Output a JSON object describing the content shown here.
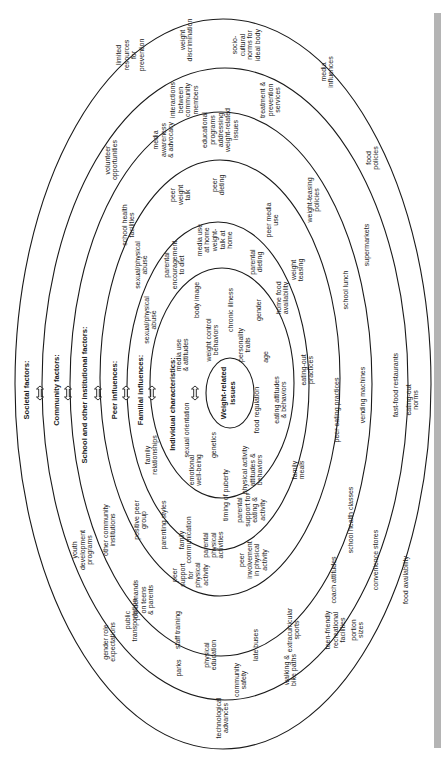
{
  "diagram": {
    "center_label": [
      "Weight-related",
      "issues"
    ],
    "rings": [
      {
        "id": "societal",
        "title": "Societal factors:",
        "cx": 223,
        "cy": 384,
        "rx": 208,
        "ry": 365,
        "title_x": 26,
        "arrow_x": 40
      },
      {
        "id": "community",
        "title": "Community factors:",
        "cx": 225,
        "cy": 384,
        "rx": 183,
        "ry": 316,
        "title_x": 56,
        "arrow_x": 68
      },
      {
        "id": "school",
        "title": "School and other institutional factors:",
        "cx": 221,
        "cy": 384,
        "rx": 151,
        "ry": 272,
        "title_x": 84,
        "arrow_x": 98
      },
      {
        "id": "peer",
        "title": "Peer influences:",
        "cx": 220,
        "cy": 378,
        "rx": 120,
        "ry": 218,
        "title_x": 114,
        "arrow_x": 126
      },
      {
        "id": "familial",
        "title": "Familial influences:",
        "cx": 218,
        "cy": 386,
        "rx": 91,
        "ry": 164,
        "title_x": 140,
        "arrow_x": 152
      },
      {
        "id": "individual",
        "title": "Individual characteristics:",
        "cx": 222,
        "cy": 383,
        "rx": 72,
        "ry": 115,
        "title_x": 172,
        "arrow_x": 195
      }
    ],
    "center": {
      "cx": 230,
      "cy": 393,
      "rx": 24,
      "ry": 35,
      "label_x": 226
    },
    "title_y": 400,
    "societal_items": [
      {
        "lines": [
          "limited",
          "resources",
          "for",
          "prevention"
        ],
        "x": 130,
        "y": 55
      },
      {
        "lines": [
          "weight",
          "discrimination"
        ],
        "x": 186,
        "y": 40
      },
      {
        "lines": [
          "socio-",
          "cultural",
          "norms for",
          "ideal body"
        ],
        "x": 246,
        "y": 45
      },
      {
        "lines": [
          "media",
          "influences"
        ],
        "x": 327,
        "y": 72
      },
      {
        "lines": [
          "food",
          "policies"
        ],
        "x": 372,
        "y": 158
      },
      {
        "lines": [
          "supermarkets"
        ],
        "x": 366,
        "y": 245
      },
      {
        "lines": [
          "eating-out",
          "norms"
        ],
        "x": 412,
        "y": 400
      },
      {
        "lines": [
          "fast-food restaurants"
        ],
        "x": 395,
        "y": 385
      },
      {
        "lines": [
          "food availability"
        ],
        "x": 405,
        "y": 580
      },
      {
        "lines": [
          "portion",
          "sizes"
        ],
        "x": 357,
        "y": 630
      },
      {
        "lines": [
          "technological",
          "advances"
        ],
        "x": 222,
        "y": 718
      },
      {
        "lines": [
          "gender role",
          "expectations"
        ],
        "x": 109,
        "y": 642
      },
      {
        "lines": [
          "youth",
          "development",
          "programs"
        ],
        "x": 82,
        "y": 550
      }
    ],
    "community_items": [
      {
        "lines": [
          "interactions",
          "between",
          "community",
          "members"
        ],
        "x": 184,
        "y": 100
      },
      {
        "lines": [
          "treatment &",
          "prevention",
          "services"
        ],
        "x": 270,
        "y": 100
      },
      {
        "lines": [
          "volunteer",
          "opportunities"
        ],
        "x": 111,
        "y": 160
      },
      {
        "lines": [
          "weight-teasing",
          "policies"
        ],
        "x": 313,
        "y": 200
      },
      {
        "lines": [
          "school lunch"
        ],
        "x": 345,
        "y": 290
      },
      {
        "lines": [
          "vending machines"
        ],
        "x": 362,
        "y": 395
      },
      {
        "lines": [
          "convenience stores"
        ],
        "x": 375,
        "y": 560
      },
      {
        "lines": [
          "teen-friendly",
          "recreational",
          "facilities"
        ],
        "x": 335,
        "y": 630
      },
      {
        "lines": [
          "walking &",
          "bike paths"
        ],
        "x": 290,
        "y": 670
      },
      {
        "lines": [
          "community",
          "safety"
        ],
        "x": 240,
        "y": 680
      },
      {
        "lines": [
          "parks"
        ],
        "x": 178,
        "y": 668
      },
      {
        "lines": [
          "public",
          "transportation"
        ],
        "x": 131,
        "y": 620
      },
      {
        "lines": [
          "other community",
          "institutions"
        ],
        "x": 109,
        "y": 530
      }
    ],
    "school_items": [
      {
        "lines": [
          "media",
          "awareness",
          "& advocacy"
        ],
        "x": 163,
        "y": 140
      },
      {
        "lines": [
          "educational",
          "programs",
          "addressing",
          "weight-related",
          "issues"
        ],
        "x": 220,
        "y": 130
      },
      {
        "lines": [
          "school health",
          "facilities"
        ],
        "x": 128,
        "y": 225
      },
      {
        "lines": [
          "weight",
          "teasing"
        ],
        "x": 297,
        "y": 270
      },
      {
        "lines": [
          "peer eating practices"
        ],
        "x": 336,
        "y": 410
      },
      {
        "lines": [
          "school health classes"
        ],
        "x": 350,
        "y": 520
      },
      {
        "lines": [
          "coach attitudes"
        ],
        "x": 333,
        "y": 580
      },
      {
        "lines": [
          "extracurricular",
          "sports"
        ],
        "x": 293,
        "y": 630
      },
      {
        "lines": [
          "late buses"
        ],
        "x": 255,
        "y": 645
      },
      {
        "lines": [
          "physical",
          "education"
        ],
        "x": 210,
        "y": 655
      },
      {
        "lines": [
          "staff training"
        ],
        "x": 177,
        "y": 630
      },
      {
        "lines": [
          "job demands",
          "on teens",
          "& parents"
        ],
        "x": 143,
        "y": 600
      }
    ],
    "peer_items": [
      {
        "lines": [
          "peer",
          "weight",
          "talk"
        ],
        "x": 180,
        "y": 195
      },
      {
        "lines": [
          "peer",
          "dieting"
        ],
        "x": 218,
        "y": 185
      },
      {
        "lines": [
          "peer media",
          "use"
        ],
        "x": 272,
        "y": 220
      },
      {
        "lines": [
          "sexual/physical",
          "abuse"
        ],
        "x": 141,
        "y": 265
      },
      {
        "lines": [
          "eating-out",
          "practices"
        ],
        "x": 307,
        "y": 370
      },
      {
        "lines": [
          "family",
          "meals"
        ],
        "x": 298,
        "y": 470
      },
      {
        "lines": [
          "peer",
          "involvement",
          "in physical",
          "activity"
        ],
        "x": 253,
        "y": 560
      },
      {
        "lines": [
          "peer",
          "support",
          "for",
          "physical",
          "activity"
        ],
        "x": 190,
        "y": 575
      },
      {
        "lines": [
          "positive peer",
          "group"
        ],
        "x": 140,
        "y": 520
      }
    ],
    "familial_items": [
      {
        "lines": [
          "parental",
          "encouragement",
          "to diet"
        ],
        "x": 174,
        "y": 265
      },
      {
        "lines": [
          "media use",
          "at home"
        ],
        "x": 203,
        "y": 240
      },
      {
        "lines": [
          "weight-",
          "talk at",
          "home"
        ],
        "x": 222,
        "y": 240
      },
      {
        "lines": [
          "parental",
          "dieting"
        ],
        "x": 256,
        "y": 262
      },
      {
        "lines": [
          "home food",
          "availability"
        ],
        "x": 282,
        "y": 298
      },
      {
        "lines": [
          "sexual/physical",
          "abuse"
        ],
        "x": 150,
        "y": 320
      },
      {
        "lines": [
          "family",
          "relationships"
        ],
        "x": 151,
        "y": 455
      },
      {
        "lines": [
          "parenting styles"
        ],
        "x": 163,
        "y": 525
      },
      {
        "lines": [
          "family",
          "communication"
        ],
        "x": 185,
        "y": 540
      },
      {
        "lines": [
          "parental",
          "physical",
          "activities"
        ],
        "x": 213,
        "y": 545
      },
      {
        "lines": [
          "parental",
          "support for",
          "eating &",
          "activity"
        ],
        "x": 251,
        "y": 510
      }
    ],
    "individual_items": [
      {
        "lines": [
          "media use",
          "& attitudes"
        ],
        "x": 182,
        "y": 355
      },
      {
        "lines": [
          "sexual orientation"
        ],
        "x": 186,
        "y": 430
      },
      {
        "lines": [
          "body image"
        ],
        "x": 196,
        "y": 300
      },
      {
        "lines": [
          "weight control",
          "behaviors"
        ],
        "x": 212,
        "y": 340
      },
      {
        "lines": [
          "chronic illness"
        ],
        "x": 230,
        "y": 310
      },
      {
        "lines": [
          "personality",
          "traits"
        ],
        "x": 244,
        "y": 345
      },
      {
        "lines": [
          "gender"
        ],
        "x": 258,
        "y": 310
      },
      {
        "lines": [
          "age"
        ],
        "x": 265,
        "y": 357
      },
      {
        "lines": [
          "eating attitudes",
          "& behaviors"
        ],
        "x": 280,
        "y": 400
      },
      {
        "lines": [
          "food regulation"
        ],
        "x": 256,
        "y": 410
      },
      {
        "lines": [
          "genetics"
        ],
        "x": 213,
        "y": 445
      },
      {
        "lines": [
          "emotional",
          "well-being"
        ],
        "x": 195,
        "y": 470
      },
      {
        "lines": [
          "timing of puberty"
        ],
        "x": 225,
        "y": 495
      },
      {
        "lines": [
          "physical activity",
          "attitudes &",
          "behaviors"
        ],
        "x": 252,
        "y": 470
      }
    ]
  }
}
